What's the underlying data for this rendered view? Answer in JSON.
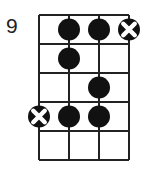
{
  "diagram": {
    "type": "bass-scale-fretboard",
    "start_fret_label": "9",
    "strings": 4,
    "frets": 5,
    "grid": {
      "left": 39,
      "top": 15,
      "string_spacing": 30,
      "fret_spacing": 29,
      "line_color": "#222222"
    },
    "dot_radius": 11,
    "dot_color": "#111111",
    "notes": [
      {
        "fret": 1,
        "string": 2,
        "kind": "filled"
      },
      {
        "fret": 1,
        "string": 3,
        "kind": "filled"
      },
      {
        "fret": 1,
        "string": 4,
        "kind": "root"
      },
      {
        "fret": 2,
        "string": 2,
        "kind": "filled"
      },
      {
        "fret": 3,
        "string": 3,
        "kind": "filled"
      },
      {
        "fret": 4,
        "string": 1,
        "kind": "root"
      },
      {
        "fret": 4,
        "string": 2,
        "kind": "filled"
      },
      {
        "fret": 4,
        "string": 3,
        "kind": "filled"
      }
    ]
  }
}
